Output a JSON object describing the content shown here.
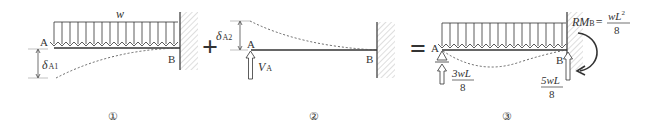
{
  "figure": {
    "panels": [
      {
        "id": "panel-1",
        "caption": "①",
        "load_label": "w",
        "point_a": "A",
        "point_b": "B",
        "deflection_label": "δ",
        "deflection_sub": "A1"
      },
      {
        "id": "panel-2",
        "caption": "②",
        "point_a": "A",
        "point_b": "B",
        "deflection_label": "δ",
        "deflection_sub": "A2",
        "reaction_label": "V",
        "reaction_sub": "A"
      },
      {
        "id": "panel-3",
        "caption": "③",
        "point_a": "A",
        "point_b": "B",
        "reaction_a_num": "3wL",
        "reaction_a_den": "8",
        "reaction_b_num": "5wL",
        "reaction_b_den": "8",
        "moment_label": "RM",
        "moment_sub": "B",
        "moment_eq": "=",
        "moment_num": "wL",
        "moment_num_sup": "2",
        "moment_den": "8"
      }
    ],
    "operators": {
      "plus": "+",
      "equals": "="
    },
    "colors": {
      "line": "#333333",
      "hatch": "#bbbbbb",
      "dashed": "#555555"
    }
  }
}
